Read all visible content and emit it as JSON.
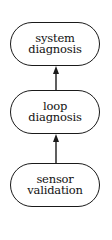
{
  "diagram": {
    "type": "flow",
    "direction": "bottom-to-top",
    "nodes": [
      {
        "id": "system",
        "lines": [
          "system",
          "diagnosis"
        ]
      },
      {
        "id": "loop",
        "lines": [
          "loop",
          "diagnosis"
        ]
      },
      {
        "id": "sensor",
        "lines": [
          "sensor",
          "validation"
        ]
      }
    ],
    "edges": [
      {
        "from": "sensor",
        "to": "loop"
      },
      {
        "from": "loop",
        "to": "system"
      }
    ],
    "colors": {
      "stroke": "#1a1a1a",
      "background": "#ffffff"
    }
  }
}
